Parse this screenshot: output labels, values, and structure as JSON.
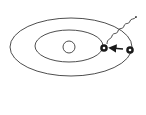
{
  "diagram": {
    "title": "Bohr atom model: electron transition with photon emission",
    "colors": {
      "stroke": "#3a3a3a",
      "electron_fill": "#1a1a1a",
      "background": "#ffffff"
    },
    "elements": {
      "nucleus": {
        "label": "nucleus",
        "cx": 69,
        "cy": 47,
        "r": 6
      },
      "orbits": [
        {
          "label": "outer orbit",
          "cx": 71,
          "cy": 47,
          "rx": 61,
          "ry": 29
        },
        {
          "label": "inner orbit",
          "cx": 69,
          "cy": 46,
          "rx": 34,
          "ry": 16
        }
      ],
      "electrons": [
        {
          "label": "electron (inner orbit, final)",
          "cx": 104,
          "cy": 48
        },
        {
          "label": "electron (outer orbit, initial)",
          "cx": 130,
          "cy": 50
        }
      ],
      "transition_arrow": {
        "label": "electron jump outer to inner",
        "from": [
          123,
          49
        ],
        "to": [
          110,
          48
        ]
      },
      "photon": {
        "label": "emitted photon (wavy line)"
      }
    }
  }
}
